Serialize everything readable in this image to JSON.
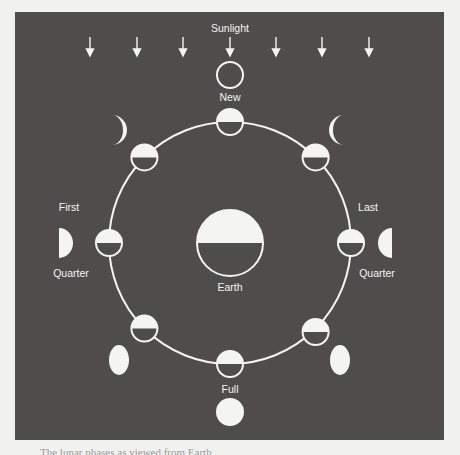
{
  "diagram": {
    "labels": {
      "sunlight": "Sunlight",
      "new": "New",
      "first": "First",
      "first_quarter": "Quarter",
      "last": "Last",
      "last_quarter": "Quarter",
      "earth": "Earth",
      "full": "Full"
    },
    "sunlight_arrows": 7,
    "orbit": {
      "cx": 230,
      "cy": 243,
      "r": 121
    },
    "orbit_moons": [
      {
        "name": "new",
        "angle_deg": 270
      },
      {
        "name": "waxing-crescent",
        "angle_deg": 225
      },
      {
        "name": "first-quarter",
        "angle_deg": 180
      },
      {
        "name": "waxing-gibbous",
        "angle_deg": 135
      },
      {
        "name": "full",
        "angle_deg": 90
      },
      {
        "name": "waning-gibbous",
        "angle_deg": 45
      },
      {
        "name": "last-quarter",
        "angle_deg": 0
      },
      {
        "name": "waning-crescent",
        "angle_deg": 315
      }
    ],
    "appearance_from_earth": [
      "new (outline)",
      "waxing crescent",
      "first quarter",
      "waxing gibbous",
      "full",
      "waning gibbous",
      "last quarter",
      "waning crescent"
    ],
    "colors": {
      "background": "#4f4d4b",
      "foreground": "#f4f4f2",
      "page": "#f1f1ef"
    }
  },
  "caption": {
    "text": "The lunar phases as viewed from Earth"
  }
}
